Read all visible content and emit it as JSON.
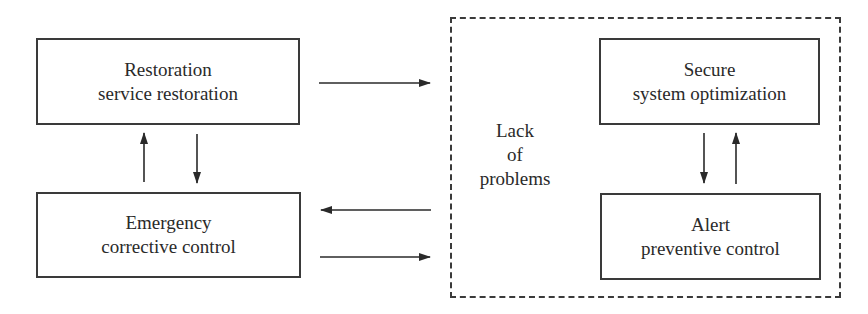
{
  "diagram": {
    "type": "state-transition",
    "boxes": [
      {
        "id": "restoration",
        "line1": "Restoration",
        "line2": "service restoration"
      },
      {
        "id": "emergency",
        "line1": "Emergency",
        "line2": "corrective control"
      },
      {
        "id": "secure",
        "line1": "Secure",
        "line2": "system optimization"
      },
      {
        "id": "alert",
        "line1": "Alert",
        "line2": "preventive control"
      }
    ],
    "region": {
      "id": "lack-of-problems",
      "style": "dashed",
      "label_lines": [
        "Lack",
        "of",
        "problems"
      ],
      "contains": [
        "secure",
        "alert"
      ]
    },
    "edges": [
      {
        "from": "restoration",
        "to": "lack-of-problems"
      },
      {
        "from": "lack-of-problems",
        "to": "emergency"
      },
      {
        "from": "emergency",
        "to": "lack-of-problems"
      },
      {
        "from": "emergency",
        "to": "restoration"
      },
      {
        "from": "restoration",
        "to": "emergency"
      },
      {
        "from": "secure",
        "to": "alert"
      },
      {
        "from": "alert",
        "to": "secure"
      }
    ],
    "colors": {
      "stroke": "#3a3a3a",
      "text": "#2a2a2a",
      "background": "#ffffff"
    }
  }
}
